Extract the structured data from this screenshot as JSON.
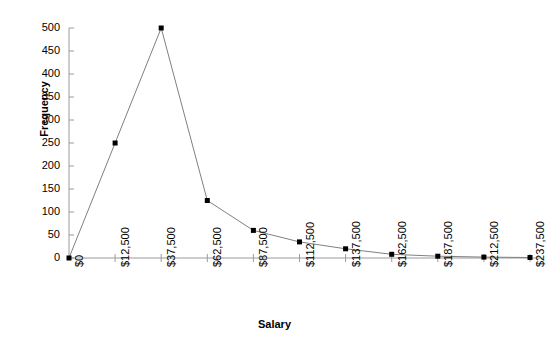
{
  "chart_data": {
    "type": "line",
    "title": "",
    "subtitle": "",
    "xlabel": "Salary",
    "ylabel": "Frequency",
    "x_tick_labels": [
      "$0",
      "$12,500",
      "$37,500",
      "$62,500",
      "$87,500",
      "$112,500",
      "$137,500",
      "$162,500",
      "$187,500",
      "$212,500",
      "$237,500"
    ],
    "y_tick_labels": [
      "0",
      "50",
      "100",
      "150",
      "200",
      "250",
      "300",
      "350",
      "400",
      "450",
      "500"
    ],
    "y_tick_values": [
      0,
      50,
      100,
      150,
      200,
      250,
      300,
      350,
      400,
      450,
      500
    ],
    "ylim": [
      0,
      500
    ],
    "grid": false,
    "legend": null,
    "marker": "square",
    "marker_color": "#000000",
    "line_color": "#808080",
    "categories": [
      "$0",
      "$12,500",
      "$37,500",
      "$62,500",
      "$87,500",
      "$112,500",
      "$137,500",
      "$162,500",
      "$187,500",
      "$212,500",
      "$237,500"
    ],
    "values": [
      0,
      250,
      500,
      125,
      60,
      35,
      20,
      8,
      4,
      2,
      1
    ],
    "series": [
      {
        "name": "Frequency",
        "values": [
          0,
          250,
          500,
          125,
          60,
          35,
          20,
          8,
          4,
          2,
          1
        ]
      }
    ],
    "annotations": []
  }
}
